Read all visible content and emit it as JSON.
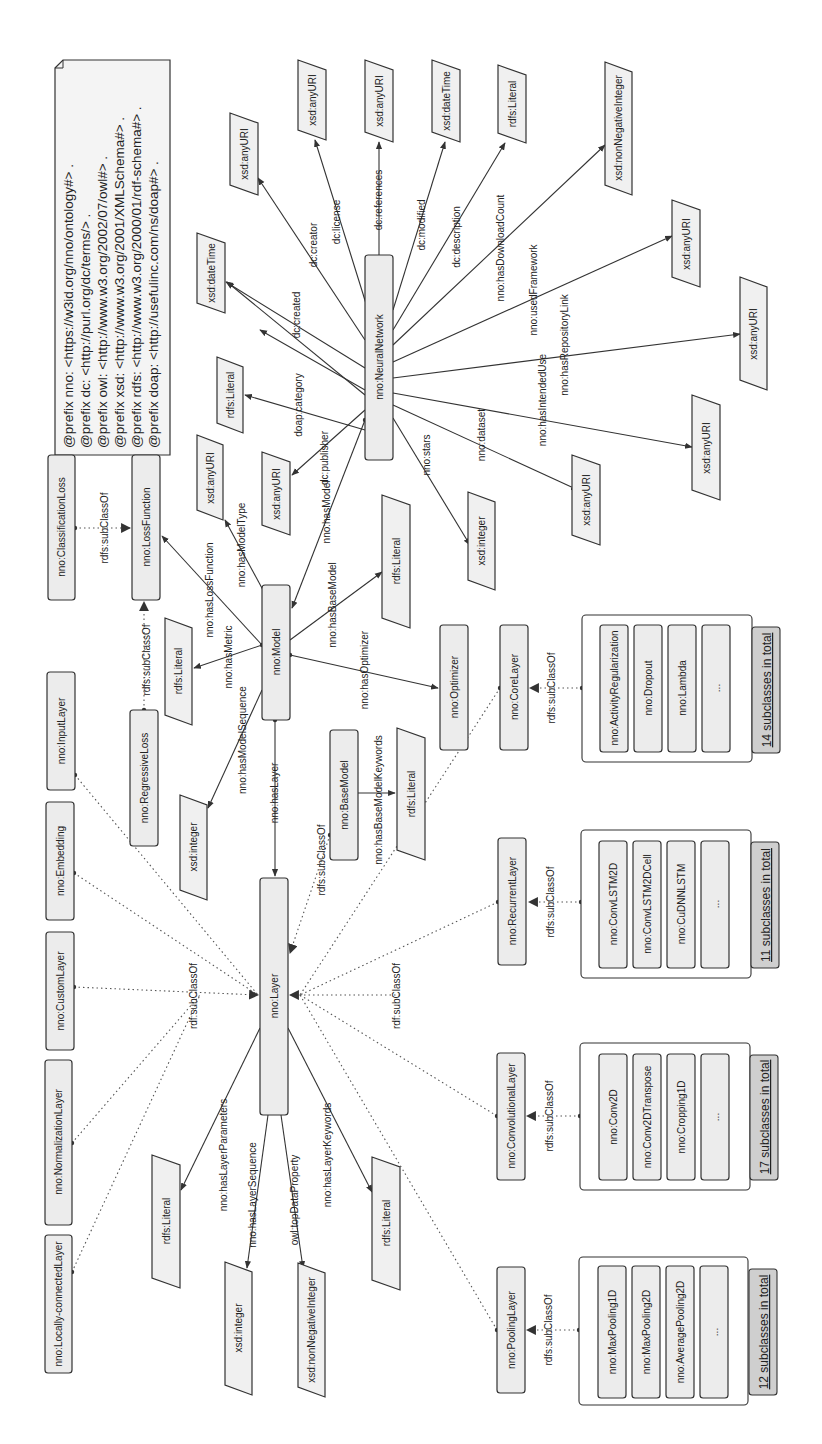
{
  "prefixes": [
    "@prefix nno: <https://w3id.org/nno/ontology#> .",
    "@prefix dc: <http://purl.org/dc/terms/> .",
    "@prefix owl: <http://www.w3.org/2002/07/owl#> .",
    "@prefix xsd: <http://www.w3.org/2001/XMLSchema#> .",
    "@prefix rdfs: <http://www.w3.org/2000/01/rdf-schema#> .",
    "@prefix doap: <http://usefulinc.com/ns/doap#> ."
  ],
  "classes": {
    "classification_loss": "nno:ClassificationLoss",
    "loss_function": "nno:LossFunction",
    "regressive_loss": "nno:RegressiveLoss",
    "input_layer": "nno:InputLayer",
    "embedding": "nno:Embedding",
    "custom_layer": "nno:CustomLayer",
    "normalization_layer": "nno:NormalizationLayer",
    "locally_connected_layer": "nno:Locally-connectedLayer",
    "model": "nno:Model",
    "layer": "nno:Layer",
    "neural_network": "nno:NeuralNetwork",
    "optimizer": "nno:Optimizer",
    "core_layer": "nno:CoreLayer",
    "base_model": "nno:BaseModel",
    "recurrent_layer": "nno:RecurrentLayer",
    "convolutional_layer": "nno:ConvolutionalLayer",
    "pooling_layer": "nno:PoolingLayer"
  },
  "literals": {
    "any_uri": "xsd:anyURI",
    "date_time": "xsd:dateTime",
    "rdfs_literal": "rdfs:Literal",
    "integer": "xsd:integer",
    "non_negative_integer": "xsd:nonNegativeInteger"
  },
  "edges": {
    "rdfs_subclassof": "rdfs:subClassOf",
    "rdf_subclassof": "rdf:subClassOf",
    "has_loss_function": "nno:hasLossFunction",
    "has_model_type": "nno:hasModelType",
    "has_metric": "nno:hasMetric",
    "has_model_sequence": "nno:hasModelSequence",
    "has_layer": "nno:hasLayer",
    "has_model": "nno:hasModel",
    "has_base_model": "nno:hasBaseModel",
    "has_optimizer": "nno:hasOptimizer",
    "has_base_model_keywords": "nno:hasBaseModelKeywords",
    "dc_publisher": "dc:publisher",
    "doap_category": "doap:category",
    "dc_created": "dc:created",
    "dc_creator": "dc:creator",
    "dc_license": "dc:license",
    "dc_references": "dc:references",
    "dc_modified": "dc:modified",
    "dc_description": "dc:description",
    "has_download_count": "nno:hasDownloadCount",
    "used_framework": "nno:usedFramework",
    "has_repository_link": "nno:hasRepositoryLink",
    "has_intended_use": "nno:hasIntendedUse",
    "dataset": "nno:dataset",
    "stars": "nno:stars",
    "has_layer_parameters": "nno:hasLayerParameters",
    "has_layer_sequence": "nno:hasLayerSequence",
    "top_data_property": "owl:topDataProperty",
    "has_layer_keywords": "nno:hasLayerKeywords"
  },
  "groups": {
    "core": {
      "items": [
        "nno:ActivityRegularization",
        "nno:Dropout",
        "nno:Lambda",
        "..."
      ],
      "total": "14 subclasses in total"
    },
    "recurrent": {
      "items": [
        "nno:ConvLSTM2D",
        "nno:ConvLSTM2DCell",
        "nno:CuDNNLSTM",
        "..."
      ],
      "total": "11 subclasses in total"
    },
    "convolutional": {
      "items": [
        "nno:Conv2D",
        "nno:Conv2DTranspose",
        "nno:Cropping1D",
        "..."
      ],
      "total": "17 subclasses in total"
    },
    "pooling": {
      "items": [
        "nno:MaxPooling1D",
        "nno:MaxPooling2D",
        "nno:AveragePooling2D",
        "..."
      ],
      "total": "12 subclasses in total"
    }
  }
}
